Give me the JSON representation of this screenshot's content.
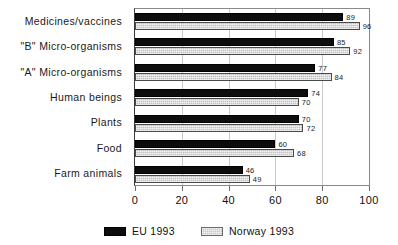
{
  "chart_data": {
    "type": "bar",
    "orientation": "horizontal",
    "title": "",
    "subtitle": "",
    "xlabel": "",
    "ylabel": "",
    "xlim": [
      0,
      100
    ],
    "xticks": [
      "0",
      "20",
      "40",
      "60",
      "80",
      "100"
    ],
    "xtick_values": [
      0,
      20,
      40,
      60,
      80,
      100
    ],
    "grid": true,
    "legend_position": "bottom-center",
    "categories": [
      "Medicines/vaccines",
      "\"B\" Micro-organisms",
      "\"A\" Micro-organisms",
      "Human beings",
      "Plants",
      "Food",
      "Farm animals"
    ],
    "series": [
      {
        "name": "EU 1993",
        "color": "#0d0d0d",
        "values": [
          89,
          85,
          77,
          74,
          70,
          60,
          46
        ]
      },
      {
        "name": "Norway 1993",
        "color": "#c2c2c2",
        "values": [
          96,
          92,
          84,
          70,
          72,
          68,
          49
        ]
      }
    ]
  },
  "legend": {
    "items": [
      {
        "label": "EU 1993"
      },
      {
        "label": "Norway 1993"
      }
    ]
  }
}
